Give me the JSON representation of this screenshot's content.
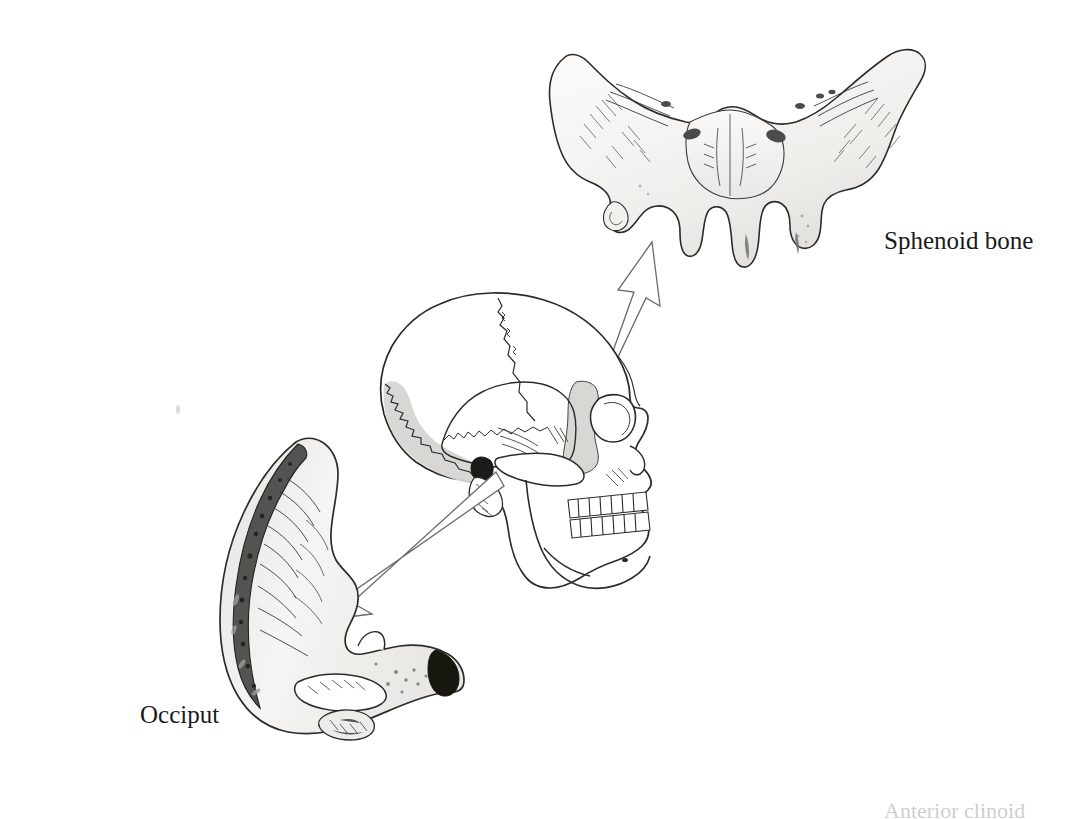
{
  "page": {
    "kind": "anatomical-illustration",
    "background_color": "#ffffff",
    "width": 1082,
    "height": 819
  },
  "labels": {
    "sphenoid": "Sphenoid bone",
    "occiput": "Occiput",
    "footnote_clipped": "Anterior clinoid"
  },
  "figures": [
    {
      "name": "sphenoid-bone",
      "label": "Sphenoid bone",
      "description": "Isolated sphenoid bone seen from anterior, butterfly shaped with greater and lesser wings and pterygoid processes",
      "bbox": [
        556,
        44,
        408,
        250
      ]
    },
    {
      "name": "skull-lateral",
      "label": "",
      "description": "Lateral view of human skull with shaded occipital and sphenoid regions",
      "bbox": [
        382,
        292,
        300,
        310
      ]
    },
    {
      "name": "occiput-bone",
      "label": "Occiput",
      "description": "Isolated occipital bone, crescent shaped, inner surface with cut cranial edge",
      "bbox": [
        196,
        430,
        270,
        320
      ]
    }
  ],
  "arrows": [
    {
      "name": "arrow-to-sphenoid",
      "from_figure": "skull-lateral",
      "to_figure": "sphenoid-bone",
      "direction": "up-right",
      "style": "outline"
    },
    {
      "name": "arrow-to-occiput",
      "from_figure": "skull-lateral",
      "to_figure": "occiput-bone",
      "direction": "down-left",
      "style": "outline"
    }
  ],
  "colors": {
    "ink": "#2b2b2b",
    "bone_fill": "#f5f4f2",
    "shade_light": "#d6d5d2",
    "shade_mid": "#a9a8a5",
    "shade_dark": "#55534f",
    "shade_black": "#1c1b19",
    "skull_highlight": "#d9d8d5",
    "paper": "#ffffff"
  }
}
